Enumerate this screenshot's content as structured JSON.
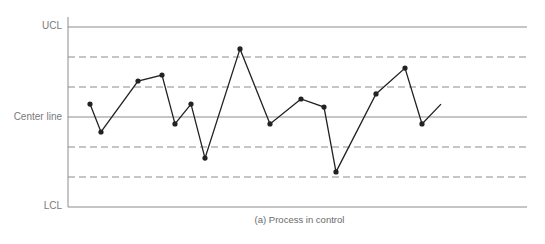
{
  "chart_data": {
    "type": "line",
    "title": "",
    "caption": "(a) Process in control",
    "xlabel": "",
    "ylabel": "",
    "y_tick_labels": [
      "UCL",
      "Center line",
      "LCL"
    ],
    "reference_lines": [
      {
        "name": "UCL",
        "value": 3,
        "style": "solid"
      },
      {
        "name": "+2 sigma",
        "value": 2,
        "style": "dashed"
      },
      {
        "name": "+1 sigma",
        "value": 1,
        "style": "dashed"
      },
      {
        "name": "Center line",
        "value": 0,
        "style": "solid"
      },
      {
        "name": "-1 sigma",
        "value": -1,
        "style": "dashed"
      },
      {
        "name": "-2 sigma",
        "value": -2,
        "style": "dashed"
      },
      {
        "name": "LCL",
        "value": -3,
        "style": "solid"
      }
    ],
    "ylim": [
      -3,
      3
    ],
    "grid": false,
    "legend": null,
    "series": [
      {
        "name": "Process measurements",
        "x": [
          1,
          2,
          3,
          4,
          5,
          6,
          7,
          8,
          9,
          10,
          11,
          12,
          13,
          14,
          15
        ],
        "values": [
          0.43,
          -0.5,
          1.2,
          1.4,
          -0.23,
          0.43,
          -1.37,
          2.27,
          -0.23,
          0.6,
          0.33,
          -1.83,
          0.77,
          1.63,
          -0.23
        ],
        "trailing_segment_end": 0.43
      }
    ]
  },
  "layout": {
    "plot_left": 68,
    "plot_right": 527,
    "center_y": 117,
    "px_per_sigma": 30,
    "point_x": [
      90,
      101,
      138,
      162,
      175,
      191,
      205,
      240,
      270,
      301,
      324,
      336,
      376,
      405,
      422
    ],
    "trailing_x": 441
  },
  "colors": {
    "data_line": "#222222",
    "control_line": "#8c8c8c",
    "dashed_line": "#8c8c8c",
    "label_text": "#7a7a7a"
  },
  "labels": {
    "ucl": "UCL",
    "center": "Center line",
    "lcl": "LCL",
    "caption": "(a) Process in control"
  }
}
